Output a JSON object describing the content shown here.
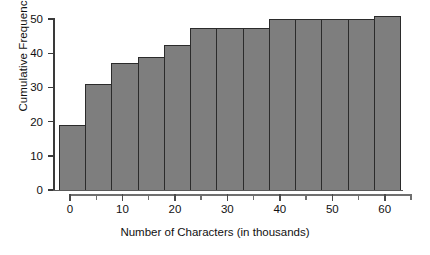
{
  "chart_data": {
    "type": "bar",
    "title": "",
    "xlabel": "Number of Characters (in thousands)",
    "ylabel": "Cumulative Frequency",
    "xlim": [
      0,
      65
    ],
    "ylim": [
      0,
      50
    ],
    "xticks": [
      0,
      5,
      10,
      15,
      20,
      25,
      30,
      35,
      40,
      45,
      50,
      55,
      60,
      65
    ],
    "xtick_labels": [
      "0",
      "10",
      "20",
      "30",
      "40",
      "50",
      "60"
    ],
    "xtick_label_values": [
      0,
      10,
      20,
      30,
      40,
      50,
      60
    ],
    "yticks": [
      0,
      10,
      20,
      30,
      40,
      50
    ],
    "ytick_labels": [
      "0",
      "10",
      "20",
      "30",
      "40",
      "50"
    ],
    "grid": false,
    "legend": false,
    "bin_width": 5,
    "bar_color": "#7e7e7e",
    "bar_edge_color": "#2b2b2b",
    "categories": [
      "0-5",
      "5-10",
      "10-15",
      "15-20",
      "20-25",
      "25-30",
      "30-35",
      "35-40",
      "40-45",
      "45-50",
      "50-55",
      "55-60",
      "60-65"
    ],
    "bin_starts": [
      0,
      5,
      10,
      15,
      20,
      25,
      30,
      35,
      40,
      45,
      50,
      55,
      60
    ],
    "bin_ends": [
      5,
      10,
      15,
      20,
      25,
      30,
      35,
      40,
      45,
      50,
      55,
      60,
      65
    ],
    "values": [
      19,
      31,
      37,
      39,
      42.5,
      47.5,
      47.5,
      47.5,
      50,
      50,
      50,
      50,
      51
    ]
  }
}
